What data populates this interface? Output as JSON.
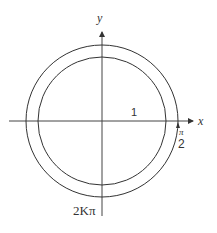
{
  "diagram": {
    "type": "concentric-circles-on-axes",
    "axes": {
      "x_label": "x",
      "y_label": "y"
    },
    "labels": {
      "radius": "1",
      "fraction_numerator": "π",
      "fraction_denominator": "2",
      "bottom": "2Kπ"
    },
    "circles": [
      {
        "name": "outer",
        "relative_radius": 1.19
      },
      {
        "name": "inner",
        "relative_radius": 1.0
      }
    ],
    "stroke_color": "#333333",
    "background": "#ffffff"
  }
}
